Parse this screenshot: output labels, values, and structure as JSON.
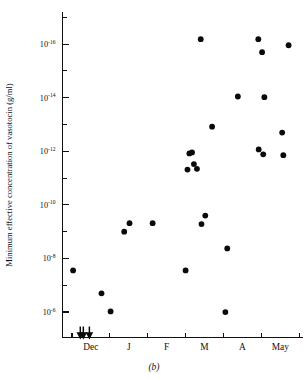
{
  "chart_data": {
    "type": "scatter",
    "title": "",
    "caption": "(b)",
    "xlabel": "",
    "ylabel": "Minimum effective concentration of vasotocin (g/ml)",
    "y_scale": "log",
    "y_axis_inverted": true,
    "ylim": [
      1e-05,
      1e-17
    ],
    "y_tick_labels": [
      "10-16",
      "10-14",
      "10-12",
      "10-10",
      "10-8",
      "10-6"
    ],
    "y_ticks_mantissa": [
      "10",
      "10",
      "10",
      "10",
      "10",
      "10"
    ],
    "y_ticks_exponent": [
      "-16",
      "-14",
      "-12",
      "-10",
      "-8",
      "-6"
    ],
    "y_ticks_value": [
      1e-16,
      1e-14,
      1e-12,
      1e-10,
      1e-08,
      1e-06
    ],
    "y_minor_ticks_value": [
      1e-17,
      1e-15,
      1e-13,
      1e-11,
      1e-09,
      1e-07,
      1e-05
    ],
    "x_tick_labels": [
      "Dec",
      "J",
      "F",
      "M",
      "A",
      "May"
    ],
    "x_tick_positions": [
      0.5,
      1.5,
      2.5,
      3.5,
      4.5,
      5.5
    ],
    "x_boundary_ticks": [
      0,
      1,
      2,
      3,
      4,
      5,
      6
    ],
    "xlim": [
      -0.25,
      6.1
    ],
    "grid": false,
    "legend": false,
    "marker": "filled-circle",
    "marker_color": "#0a0a0a",
    "points": [
      {
        "x": 0.03,
        "y": 2.8e-08
      },
      {
        "x": 0.78,
        "y": 2e-07
      },
      {
        "x": 1.02,
        "y": 9.5e-07
      },
      {
        "x": 1.38,
        "y": 1e-09
      },
      {
        "x": 1.52,
        "y": 4.8e-10
      },
      {
        "x": 2.13,
        "y": 4.8e-10
      },
      {
        "x": 3.0,
        "y": 2.8e-08
      },
      {
        "x": 3.05,
        "y": 4.8e-12
      },
      {
        "x": 3.1,
        "y": 1.2e-12
      },
      {
        "x": 3.17,
        "y": 1.1e-12
      },
      {
        "x": 3.22,
        "y": 3e-12
      },
      {
        "x": 3.3,
        "y": 4.5e-12
      },
      {
        "x": 3.4,
        "y": 6.5e-17
      },
      {
        "x": 3.42,
        "y": 5.2e-10
      },
      {
        "x": 3.52,
        "y": 2.5e-10
      },
      {
        "x": 3.7,
        "y": 1.2e-13
      },
      {
        "x": 4.1,
        "y": 4.2e-09
      },
      {
        "x": 4.05,
        "y": 1e-06
      },
      {
        "x": 4.38,
        "y": 9e-15
      },
      {
        "x": 4.92,
        "y": 6.5e-17
      },
      {
        "x": 5.02,
        "y": 2e-16
      },
      {
        "x": 5.08,
        "y": 9.5e-15
      },
      {
        "x": 4.93,
        "y": 8.5e-13
      },
      {
        "x": 5.05,
        "y": 1.3e-12
      },
      {
        "x": 5.55,
        "y": 2e-13
      },
      {
        "x": 5.58,
        "y": 1.4e-12
      },
      {
        "x": 5.72,
        "y": 1.1e-16
      }
    ],
    "censored_markers": {
      "symbol": "down-arrow",
      "note": "below detection limit",
      "x_values": [
        0.22,
        0.3,
        0.46
      ]
    }
  }
}
